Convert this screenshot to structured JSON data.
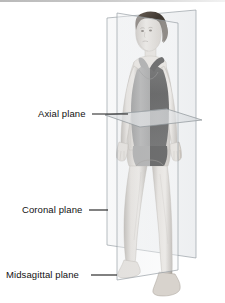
{
  "figure": {
    "background_color": "#ffffff",
    "width": 225,
    "height": 303
  },
  "labels": [
    {
      "id": "axial",
      "text": "Axial plane",
      "leader_from_x": 92,
      "leader_to_x": 128,
      "leader_y": 114
    },
    {
      "id": "coronal",
      "text": "Coronal plane",
      "leader_from_x": 89,
      "leader_to_x": 108,
      "leader_y": 210
    },
    {
      "id": "midsagittal",
      "text": "Midsagittal plane",
      "leader_from_x": 91,
      "leader_to_x": 117,
      "leader_y": 275
    }
  ],
  "planes": [
    {
      "id": "coronal",
      "name": "Coronal plane",
      "description": "Vertical frontal plane dividing body into anterior and posterior",
      "fill": "#e8eaec",
      "stroke": "#9aa0a6",
      "opacity": 0.55
    },
    {
      "id": "midsagittal",
      "name": "Midsagittal plane",
      "description": "Vertical plane dividing body into left and right halves",
      "fill": "#eceef0",
      "stroke": "#9aa0a6",
      "opacity": 0.5
    },
    {
      "id": "axial",
      "name": "Axial plane",
      "description": "Horizontal transverse plane dividing body into superior and inferior",
      "fill": "#dfe2e5",
      "stroke": "#8d9398",
      "opacity": 0.7
    }
  ],
  "subject": {
    "description": "Standing female figure in anatomical position, facing viewer",
    "skin_tone": "#d9d4cf",
    "skin_shadow": "#a9a39c",
    "hair_color": "#4a423b",
    "swimsuit_left_color": "#8e8e8e",
    "swimsuit_right_color": "#1c1c1c"
  },
  "leader_line_color": "#1a1a1a",
  "top_rule_color": "#c2c2c2"
}
